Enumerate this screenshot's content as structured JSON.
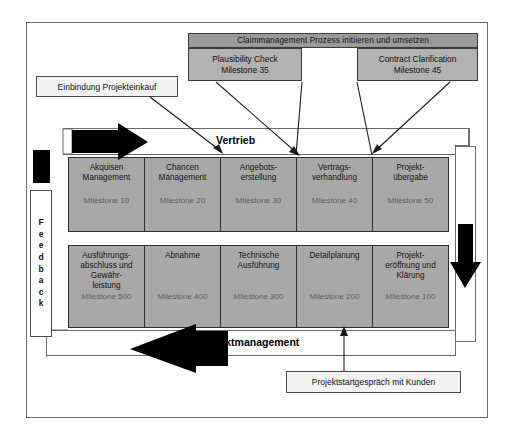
{
  "diagram": {
    "colors": {
      "process_fill": "#a8a8a8",
      "header_fill": "#9a9a9a",
      "subheader_fill": "#b2b2b2",
      "light_fill": "#f2f2f2",
      "arrow_fill": "#000000",
      "frame_stroke": "#6b6b6b",
      "milestone_text": "#5d5d5d"
    }
  },
  "claim_header": {
    "label": "Claimmanagement Prozess initiieren und umsetzen"
  },
  "claim_children": [
    {
      "title": "Plausibility Check",
      "milestone": "Milestone 35"
    },
    {
      "title": "Contract Clarification",
      "milestone": "Milestone 45"
    }
  ],
  "notes": {
    "purchasing": "Einbindung Projekteinkauf",
    "kickoff": "Projektstartgespräch mit Kunden"
  },
  "bands": {
    "sales_label": "Vertrieb",
    "project_label": "Projektmanagement"
  },
  "feedback": {
    "label": "Feedback",
    "letters": [
      "F",
      "e",
      "e",
      "d",
      "b",
      "a",
      "c",
      "k"
    ]
  },
  "sales_row": [
    {
      "title": "Akquisen\nManagement",
      "line1": "Akquisen",
      "line2": "Management",
      "milestone": "Milestone 10"
    },
    {
      "title": "Chancen\nManagement",
      "line1": "Chancen",
      "line2": "Management",
      "milestone": "Milestone 20"
    },
    {
      "title": "Angebots-\nerstellung",
      "line1": "Angebots-",
      "line2": "erstellung",
      "milestone": "Milestone 30"
    },
    {
      "title": "Vertrags-\nverhandlung",
      "line1": "Vertrags-",
      "line2": "verhandlung",
      "milestone": "Milestone 40"
    },
    {
      "title": "Projekt-\nübergabe",
      "line1": "Projekt-",
      "line2": "übergabe",
      "milestone": "Milestone 50"
    }
  ],
  "project_row": [
    {
      "line1": "Ausführungs-",
      "line2": "abschluss und",
      "line3": "Gewähr-",
      "line4": "leistung",
      "milestone": "Milestone 500"
    },
    {
      "line1": "Abnahme",
      "line2": "",
      "line3": "",
      "line4": "",
      "milestone": "Milestone 400"
    },
    {
      "line1": "Technische",
      "line2": "Ausführung",
      "line3": "",
      "line4": "",
      "milestone": "Milestone 300"
    },
    {
      "line1": "Detailplanung",
      "line2": "",
      "line3": "",
      "line4": "",
      "milestone": "Milestone 200"
    },
    {
      "line1": "Projekt-",
      "line2": "eröffnung und",
      "line3": "Klärung",
      "line4": "",
      "milestone": "Milestone 100"
    }
  ]
}
